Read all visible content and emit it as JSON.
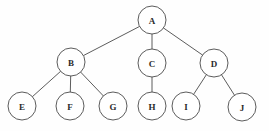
{
  "diagram": {
    "type": "rooted-tree",
    "background_color": "#fefefe",
    "stroke_color": "#4a4a4a",
    "node_fill_color": "#ffffff",
    "label_color": "#2b2b2b",
    "node_radius": 14,
    "nodes": [
      {
        "id": "A",
        "label": "A",
        "cx": 152,
        "cy": 20,
        "r": 14,
        "level": 0
      },
      {
        "id": "B",
        "label": "B",
        "cx": 71,
        "cy": 62,
        "r": 14,
        "level": 1
      },
      {
        "id": "C",
        "label": "C",
        "cx": 152,
        "cy": 63,
        "r": 14,
        "level": 1
      },
      {
        "id": "D",
        "label": "D",
        "cx": 214,
        "cy": 63,
        "r": 14,
        "level": 1
      },
      {
        "id": "E",
        "label": "E",
        "cx": 22,
        "cy": 106,
        "r": 14,
        "level": 2
      },
      {
        "id": "F",
        "label": "F",
        "cx": 70,
        "cy": 106,
        "r": 14,
        "level": 2
      },
      {
        "id": "G",
        "label": "G",
        "cx": 113,
        "cy": 106,
        "r": 14,
        "level": 2
      },
      {
        "id": "H",
        "label": "H",
        "cx": 152,
        "cy": 106,
        "r": 14,
        "level": 2
      },
      {
        "id": "I",
        "label": "I",
        "cx": 186,
        "cy": 106,
        "r": 14,
        "level": 2
      },
      {
        "id": "J",
        "label": "J",
        "cx": 242,
        "cy": 107,
        "r": 14,
        "level": 2
      }
    ],
    "edges": [
      {
        "from": "A",
        "to": "B"
      },
      {
        "from": "A",
        "to": "C"
      },
      {
        "from": "A",
        "to": "D"
      },
      {
        "from": "B",
        "to": "E"
      },
      {
        "from": "B",
        "to": "F"
      },
      {
        "from": "B",
        "to": "G"
      },
      {
        "from": "C",
        "to": "H"
      },
      {
        "from": "D",
        "to": "I"
      },
      {
        "from": "D",
        "to": "J"
      }
    ]
  }
}
